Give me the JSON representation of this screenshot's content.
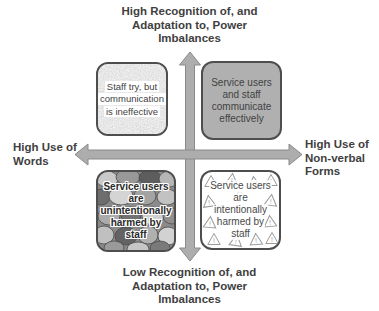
{
  "diagram": {
    "type": "quadrant-matrix",
    "axis_labels": {
      "top": "High Recognition of, and\nAdaptation to, Power\nImbalances",
      "bottom": "Low Recognition of, and\nAdaptation to, Power\nImbalances",
      "left": "High Use of\nWords",
      "right": "High Use of\nNon-verbal\nForms"
    },
    "quadrants": {
      "top_left": {
        "lines": [
          "Staff try, but",
          "communication",
          "is ineffective"
        ],
        "texture": "speckled-noise"
      },
      "top_right": {
        "lines": [
          "Service users",
          "and staff",
          "communicate",
          "effectively"
        ],
        "fill": "#b0b0b0"
      },
      "bottom_left": {
        "lines": [
          "Service users",
          "are",
          "unintentionally",
          "harmed by",
          "staff"
        ],
        "texture": "pebbles"
      },
      "bottom_right": {
        "lines": [
          "Service users",
          "are",
          "intentionally",
          "harmed by",
          "staff"
        ],
        "texture": "warning-triangles",
        "pattern_glyph": "!"
      }
    },
    "colors": {
      "text": "#3f3f3f",
      "arrow_fill": "#adadad",
      "arrow_stroke": "#8a8a8a",
      "box_border": "#4e4e4e",
      "top_right_fill": "#b0b0b0",
      "background": "#ffffff"
    }
  }
}
